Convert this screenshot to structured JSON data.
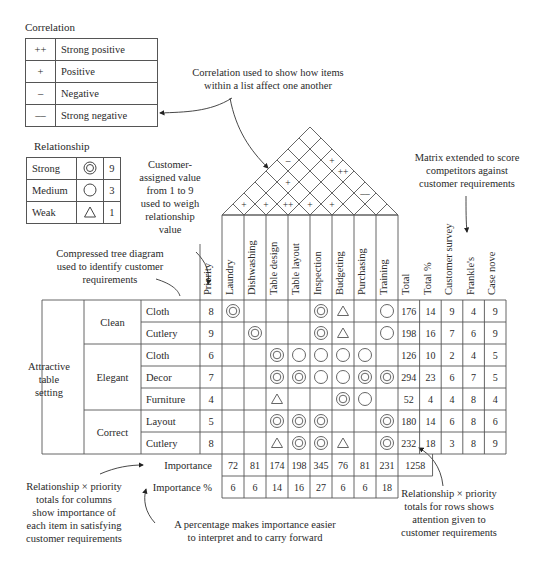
{
  "correlation_legend": {
    "title": "Correlation",
    "rows": [
      {
        "symbol": "++",
        "label": "Strong positive"
      },
      {
        "symbol": "+",
        "label": "Positive"
      },
      {
        "symbol": "–",
        "label": "Negative"
      },
      {
        "symbol": "––",
        "label": "Strong negative"
      }
    ]
  },
  "relationship_legend": {
    "title": "Relationship",
    "rows": [
      {
        "label": "Strong",
        "symbol": "double-circle",
        "value": "9"
      },
      {
        "label": "Medium",
        "symbol": "circle",
        "value": "3"
      },
      {
        "label": "Weak",
        "symbol": "triangle",
        "value": "1"
      }
    ]
  },
  "annotations": {
    "correlation_note": [
      "Correlation used to show how items",
      "within a list affect one another"
    ],
    "priority_note": [
      "Customer-",
      "assigned value",
      "from 1 to 9",
      "used to weigh",
      "relationship",
      "value"
    ],
    "tree_note": [
      "Compressed tree diagram",
      "used to identify customer",
      "requirements"
    ],
    "competitor_note": [
      "Matrix extended to score",
      "competitors against",
      "customer requirements"
    ],
    "column_totals_note": [
      "Relationship × priority",
      "totals for columns",
      "show importance of",
      "each item in satisfying",
      "customer requirements"
    ],
    "percentage_note": [
      "A percentage makes importance easier",
      "to interpret and to carry forward"
    ],
    "row_totals_note": [
      "Relationship × priority",
      "totals for rows shows",
      "attention given to",
      "customer requirements"
    ]
  },
  "matrix": {
    "root": [
      "Attractive",
      "table",
      "setting"
    ],
    "columns": {
      "priority": "Priority",
      "items": [
        "Laundry",
        "Dishwashing",
        "Table design",
        "Table layout",
        "Inspection",
        "Budgeting",
        "Purchasing",
        "Training"
      ],
      "extra": [
        "Total",
        "Total %",
        "Customer survey",
        "Frankle's",
        "Case nove"
      ]
    },
    "groups": [
      {
        "name": "Clean",
        "rows": [
          0,
          1
        ]
      },
      {
        "name": "Elegant",
        "rows": [
          2,
          3,
          4
        ]
      },
      {
        "name": "Correct",
        "rows": [
          5,
          6
        ]
      }
    ],
    "rows": [
      {
        "item": "Cloth",
        "priority": "8",
        "rel": [
          "S",
          "",
          "",
          "",
          "S",
          "W",
          "",
          "M"
        ],
        "total": "176",
        "total_pct": "14",
        "survey": "9",
        "frankles": "4",
        "case_nove": "9"
      },
      {
        "item": "Cutlery",
        "priority": "9",
        "rel": [
          "",
          "S",
          "",
          "",
          "S",
          "W",
          "",
          "M"
        ],
        "total": "198",
        "total_pct": "16",
        "survey": "7",
        "frankles": "6",
        "case_nove": "9"
      },
      {
        "item": "Cloth",
        "priority": "6",
        "rel": [
          "",
          "",
          "S",
          "M",
          "M",
          "M",
          "M",
          ""
        ],
        "total": "126",
        "total_pct": "10",
        "survey": "2",
        "frankles": "4",
        "case_nove": "5"
      },
      {
        "item": "Decor",
        "priority": "7",
        "rel": [
          "",
          "",
          "S",
          "S",
          "M",
          "M",
          "S",
          "S"
        ],
        "total": "294",
        "total_pct": "23",
        "survey": "6",
        "frankles": "7",
        "case_nove": "5"
      },
      {
        "item": "Furniture",
        "priority": "4",
        "rel": [
          "",
          "",
          "W",
          "",
          "",
          "S",
          "M",
          ""
        ],
        "total": "52",
        "total_pct": "4",
        "survey": "4",
        "frankles": "8",
        "case_nove": "4"
      },
      {
        "item": "Layout",
        "priority": "5",
        "rel": [
          "",
          "",
          "S",
          "S",
          "S",
          "",
          "",
          "S"
        ],
        "total": "180",
        "total_pct": "14",
        "survey": "6",
        "frankles": "8",
        "case_nove": "6"
      },
      {
        "item": "Cutlery",
        "priority": "8",
        "rel": [
          "",
          "",
          "W",
          "S",
          "S",
          "W",
          "",
          "S"
        ],
        "total": "232",
        "total_pct": "18",
        "survey": "3",
        "frankles": "8",
        "case_nove": "9"
      }
    ],
    "importance": {
      "label": "Importance",
      "values": [
        "72",
        "81",
        "174",
        "198",
        "345",
        "76",
        "81",
        "231"
      ],
      "grand_total": "1258"
    },
    "importance_pct": {
      "label": "Importance %",
      "values": [
        "6",
        "6",
        "14",
        "16",
        "27",
        "6",
        "6",
        "18"
      ]
    }
  },
  "roof": {
    "cells": [
      {
        "i": 1,
        "j": 2,
        "symbol": "+"
      },
      {
        "i": 2,
        "j": 3,
        "symbol": "+"
      },
      {
        "i": 3,
        "j": 4,
        "symbol": "++"
      },
      {
        "i": 4,
        "j": 5,
        "symbol": "+"
      },
      {
        "i": 5,
        "j": 6,
        "symbol": "+"
      },
      {
        "i": 2,
        "j": 5,
        "symbol": "+"
      },
      {
        "i": 6,
        "j": 8,
        "symbol": "––"
      },
      {
        "i": 4,
        "j": 8,
        "symbol": "++"
      },
      {
        "i": 1,
        "j": 6,
        "symbol": "–"
      },
      {
        "i": 3,
        "j": 8,
        "symbol": "+"
      }
    ]
  }
}
